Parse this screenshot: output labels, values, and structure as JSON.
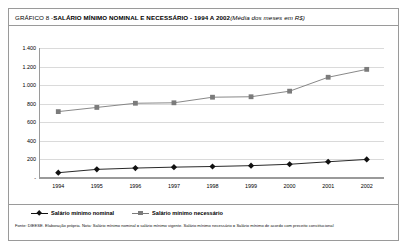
{
  "figure": {
    "title_prefix": "GRÁFICO 8 - ",
    "title_main": "SALÁRIO MÍNIMO NOMINAL E NECESSÁRIO - 1994 A 2002",
    "title_note": " (Média dos meses em R$)",
    "footnote": "Fonte: DIEESE. Elaboração própria. Nota: Salário mínimo nominal = salário mínimo vigente. Salário mínimo necessário = Salário mínimo de acordo com preceito constitucional",
    "colors": {
      "nominal": "#111111",
      "necessario": "#7b7b7b",
      "grid": "#dadada",
      "axis": "#9a9a9a",
      "border": "#9a9a9a",
      "background": "#ffffff"
    }
  },
  "legend": {
    "position": "bottom-left",
    "items": [
      {
        "label": "Salário mínimo nominal",
        "marker": "diamond",
        "color": "#111111"
      },
      {
        "label": "Salário mínimo necessário",
        "marker": "square",
        "color": "#7b7b7b"
      }
    ]
  },
  "chart_data": {
    "type": "line",
    "title": "GRÁFICO 8 - SALÁRIO MÍNIMO NOMINAL E NECESSÁRIO - 1994 A 2002 (Média dos meses em R$)",
    "subtitle": "Média dos meses em R$",
    "xlabel": "",
    "ylabel": "",
    "categories": [
      "1994",
      "1995",
      "1996",
      "1997",
      "1998",
      "1999",
      "2000",
      "2001",
      "2002"
    ],
    "ylim": [
      0,
      1400
    ],
    "yticks": [
      0,
      200,
      400,
      600,
      800,
      1000,
      1200,
      1400
    ],
    "ytick_labels": [
      "-",
      "200",
      "400",
      "600",
      "800",
      "1.000",
      "1.200",
      "1.400"
    ],
    "grid": true,
    "legend_position": "bottom-left",
    "series": [
      {
        "name": "Salário mínimo nominal",
        "color": "#111111",
        "marker": "diamond",
        "values": [
          57,
          93,
          107,
          117,
          124,
          133,
          148,
          175,
          200
        ]
      },
      {
        "name": "Salário mínimo necessário",
        "color": "#7b7b7b",
        "marker": "square",
        "values": [
          715,
          760,
          805,
          810,
          870,
          875,
          935,
          1085,
          1170
        ]
      }
    ]
  }
}
